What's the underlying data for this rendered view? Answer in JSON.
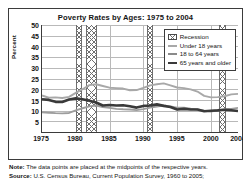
{
  "chart_data": {
    "type": "line",
    "title": "Poverty Rates by Ages: 1975 to 2004",
    "xlabel": "",
    "ylabel": "Percent",
    "ylim": [
      0,
      50
    ],
    "xlim": [
      1975,
      2004
    ],
    "yticks": [
      50,
      45,
      40,
      35,
      30,
      25,
      20,
      15,
      10,
      5
    ],
    "xticks": [
      1975,
      1980,
      1985,
      1990,
      1995,
      2000,
      2004
    ],
    "grid": true,
    "legend_position": "top-right",
    "x": [
      1975,
      1976,
      1977,
      1978,
      1979,
      1980,
      1981,
      1982,
      1983,
      1984,
      1985,
      1986,
      1987,
      1988,
      1989,
      1990,
      1991,
      1992,
      1993,
      1994,
      1995,
      1996,
      1997,
      1998,
      1999,
      2000,
      2001,
      2002,
      2003,
      2004
    ],
    "series": [
      {
        "name": "Under 18 years",
        "color": "#a8a8a8",
        "values": [
          17.1,
          16.0,
          16.2,
          15.9,
          16.4,
          18.3,
          20.0,
          21.9,
          22.3,
          21.5,
          20.7,
          20.5,
          20.3,
          19.5,
          19.6,
          20.6,
          21.8,
          22.3,
          22.7,
          21.8,
          20.8,
          20.5,
          19.9,
          18.9,
          16.9,
          16.2,
          16.3,
          16.7,
          17.6,
          17.8
        ]
      },
      {
        "name": "18 to 64 years",
        "color": "#9d9d9d",
        "values": [
          9.2,
          9.0,
          8.8,
          8.7,
          8.9,
          10.1,
          11.1,
          12.0,
          12.4,
          11.7,
          11.3,
          10.8,
          10.6,
          10.5,
          10.2,
          10.7,
          11.4,
          11.9,
          12.4,
          11.9,
          11.4,
          11.4,
          10.9,
          10.5,
          10.0,
          9.6,
          10.1,
          10.6,
          10.8,
          11.3
        ]
      },
      {
        "name": "65 years and older",
        "color": "#3a3a3a",
        "values": [
          15.3,
          15.0,
          14.1,
          14.0,
          15.2,
          15.7,
          15.3,
          14.6,
          13.8,
          12.4,
          12.6,
          12.4,
          12.5,
          12.0,
          11.4,
          12.2,
          12.4,
          12.9,
          12.2,
          11.7,
          10.5,
          10.8,
          10.5,
          10.5,
          9.7,
          9.9,
          10.1,
          10.4,
          10.2,
          9.8
        ]
      }
    ],
    "recessions": [
      {
        "start": 1980.0,
        "end": 1980.6
      },
      {
        "start": 1981.5,
        "end": 1982.9
      },
      {
        "start": 1990.5,
        "end": 1991.2
      },
      {
        "start": 2001.2,
        "end": 2001.9
      }
    ]
  },
  "legend": {
    "items": [
      {
        "label": "Recession",
        "type": "hatch"
      },
      {
        "label": "Under 18 years",
        "type": "line",
        "color": "#a8a8a8"
      },
      {
        "label": "18 to 64 years",
        "type": "line",
        "color": "#8a8a8a"
      },
      {
        "label": "65 years and older",
        "type": "line",
        "color": "#3a3a3a"
      }
    ]
  },
  "footer": {
    "note_label": "Note:",
    "note_text": " The data points are placed at the midpoints of the respective years.",
    "source_label": "Source:",
    "source_text": " U.S. Census Bureau, Current Population Survey, 1960 to 2005;"
  }
}
